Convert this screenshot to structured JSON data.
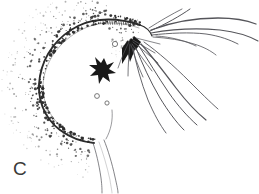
{
  "figure": {
    "domain": "scientific-line-illustration",
    "panel_label": "C",
    "background_color": "#ffffff",
    "ink_color": "#2b2b2b",
    "hairline_color": "#55555a",
    "stipple_color": "#2e2e2e",
    "label_color": "#3a3a3a"
  },
  "elements": {
    "body_outline_name": "body-outline",
    "stipple_field_name": "stipple-shading",
    "star_mark_name": "dark-star-mark",
    "pores_name": "pore-ring",
    "appendages_name": "appendage-strand",
    "stalk_name": "body-stalk"
  },
  "graphics": {
    "body_outline_path": "M 140 25 C 120 18, 96 17, 78 26 C 58 36, 44 54, 40 76 C 36 98, 44 118, 60 130 C 72 139, 84 142, 94 143",
    "body_inner_path": "M 139 28 C 119 21, 98 21, 81 30 C 62 40, 48 57, 44 77 C 40 97, 48 116, 63 128",
    "stalk_left_path": "M 93 143 C 96 152, 99 164, 101 178 C 102 186, 102 190, 102 193",
    "stalk_right_path": "M 104 140 C 108 150, 112 163, 115 177 C 117 186, 118 190, 118 193",
    "stalk_mid_path": "M 99 142 C 103 153, 107 166, 110 180 C 111 187, 112 191, 112 193",
    "neck_right_path": "M 112 110 C 113 120, 111 130, 106 139",
    "head_right_path": "M 140 25 C 146 27, 150 31, 152 36",
    "pores": [
      {
        "cx": 115,
        "cy": 44,
        "r": 2.6,
        "name": "pore-ring-upper"
      },
      {
        "cx": 97,
        "cy": 96,
        "r": 2.4,
        "name": "pore-ring-lower"
      },
      {
        "cx": 107,
        "cy": 103,
        "r": 2.1,
        "name": "pore-ring-mid"
      }
    ],
    "star_mark": {
      "cx": 104,
      "cy": 69,
      "path": "M 104 58 L 107 65 L 114 62 L 109 69 L 116 73 L 108 74 L 110 82 L 103 77 L 99 84 L 98 75 L 90 76 L 96 70 L 89 65 L 97 65 L 95 57 L 101 63 Z"
    },
    "upper_appendages": [
      {
        "name": "appendage-strand-1",
        "d": "M 151 30 C 172 22, 196 18, 218 18 C 234 18, 246 20, 256 24",
        "w": 1.3
      },
      {
        "name": "appendage-strand-2",
        "d": "M 151 33 C 173 29, 198 28, 220 30 C 237 32, 249 36, 258 41",
        "w": 1.1
      },
      {
        "name": "appendage-strand-3",
        "d": "M 150 31 C 166 24, 180 16, 190 9",
        "w": 1.0
      },
      {
        "name": "appendage-strand-4",
        "d": "M 152 35 C 170 33, 190 32, 206 34 C 220 36, 230 40, 238 44",
        "w": 0.9
      },
      {
        "name": "appendage-strand-5",
        "d": "M 156 36 C 172 37, 186 41, 196 46",
        "w": 0.8
      },
      {
        "name": "appendage-strand-6",
        "d": "M 149 28 C 160 21, 172 14, 182 9",
        "w": 0.8
      },
      {
        "name": "appendage-strand-7",
        "d": "M 153 37 C 168 38, 182 40, 194 44 C 204 47, 211 51, 216 55",
        "w": 0.8
      }
    ],
    "lower_appendages": [
      {
        "name": "appendage-strand-8",
        "d": "M 141 44 C 152 56, 164 72, 176 88 C 186 101, 196 112, 206 120",
        "w": 1.2
      },
      {
        "name": "appendage-strand-9",
        "d": "M 139 46 C 148 60, 158 77, 169 93 C 178 106, 188 117, 197 125",
        "w": 1.0
      },
      {
        "name": "appendage-strand-10",
        "d": "M 136 48 C 142 63, 150 81, 160 98 C 168 111, 176 122, 184 130",
        "w": 1.0
      },
      {
        "name": "appendage-strand-11",
        "d": "M 133 48 C 136 64, 141 82, 148 100 C 154 114, 160 125, 166 133",
        "w": 0.9
      },
      {
        "name": "appendage-strand-12",
        "d": "M 144 42 C 158 52, 174 66, 189 81 C 200 92, 210 102, 218 109",
        "w": 0.9
      }
    ],
    "head_setae": [
      {
        "name": "seta-1",
        "d": "M 133 40 C 140 44, 148 49, 155 53",
        "w": 0.8
      },
      {
        "name": "seta-2",
        "d": "M 133 42 C 141 48, 150 56, 158 63",
        "w": 0.8
      },
      {
        "name": "seta-3",
        "d": "M 132 44 C 138 52, 145 62, 152 71",
        "w": 0.8
      },
      {
        "name": "seta-4",
        "d": "M 131 45 C 134 55, 138 66, 143 77",
        "w": 0.8
      },
      {
        "name": "seta-5",
        "d": "M 130 44 C 129 54, 128 65, 128 76",
        "w": 0.8
      },
      {
        "name": "seta-6",
        "d": "M 129 42 C 125 50, 121 59, 118 68",
        "w": 0.7
      },
      {
        "name": "seta-7",
        "d": "M 136 38 C 144 40, 152 42, 160 44",
        "w": 0.7
      }
    ],
    "head_wedges": [
      {
        "name": "head-wedge-1",
        "d": "M 131 38 L 137 44 L 130 62 L 126 46 Z"
      },
      {
        "name": "head-wedge-2",
        "d": "M 128 40 L 132 48 L 122 64 L 122 48 Z"
      },
      {
        "name": "head-wedge-3",
        "d": "M 134 36 L 141 42 L 136 50 L 130 44 Z"
      }
    ],
    "head_comb_path": "M 102 22 L 140 24",
    "head_comb_ticks": 17
  },
  "stipple_params": {
    "count": 560,
    "seed": 1973,
    "band_inner": -4,
    "band_outer": 38,
    "min_radius": 0.38,
    "max_radius": 1.45
  }
}
